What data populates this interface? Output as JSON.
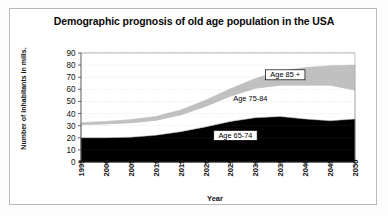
{
  "chart_data": {
    "type": "area",
    "title": "Demographic prognosis of old age population in the USA",
    "xlabel": "Year",
    "ylabel": "Number of inhabitants in mills.",
    "stacked": true,
    "grid": true,
    "grid_style": "dashed-horizontal",
    "legend_position": "inline-labels",
    "xlim": [
      1995,
      2050
    ],
    "ylim": [
      0,
      90
    ],
    "ytick_labels": [
      "0",
      "10",
      "20",
      "30",
      "40",
      "50",
      "60",
      "70",
      "80",
      "90"
    ],
    "yticks": [
      0,
      10,
      20,
      30,
      40,
      50,
      60,
      70,
      80,
      90
    ],
    "categories": [
      1995,
      2000,
      2005,
      2010,
      2015,
      2020,
      2025,
      2030,
      2035,
      2040,
      2045,
      2050
    ],
    "xtick_labels": [
      "1995",
      "2000",
      "2005",
      "2010",
      "2015",
      "2020",
      "2025",
      "2030",
      "2035",
      "2040",
      "2045",
      "2050"
    ],
    "series": [
      {
        "name": "Age 65-74",
        "label": "Age 65-74",
        "color": "#000000",
        "values": [
          20,
          20,
          20.5,
          22,
          25,
          29,
          33.5,
          36.5,
          37.5,
          35.5,
          34,
          35.5
        ]
      },
      {
        "name": "Age 75-84",
        "label": "Age 75-84",
        "color": "#ffffff",
        "values": [
          11,
          11.5,
          12,
          12.5,
          14,
          17,
          21,
          24.5,
          26,
          28,
          29.5,
          24
        ]
      },
      {
        "name": "Age 85 +",
        "label": "Age 85 +",
        "color": "#c0c0c0",
        "values": [
          1.5,
          2,
          2.5,
          3,
          4,
          5,
          6,
          8,
          11.5,
          14.5,
          16,
          20.5
        ]
      }
    ],
    "cumulative_totals": [
      32.5,
      33.5,
      35,
      37.5,
      43,
      51,
      60.5,
      69,
      75,
      78,
      79.5,
      80
    ],
    "series_annotations": [
      {
        "text": "Age 85 +",
        "x": 2036,
        "y": 72,
        "boxed": true
      },
      {
        "text": "Age 75-84",
        "x": 2029,
        "y": 52,
        "boxed": false
      },
      {
        "text": "Age 65-74",
        "x": 2026,
        "y": 22,
        "boxed": true
      }
    ]
  }
}
